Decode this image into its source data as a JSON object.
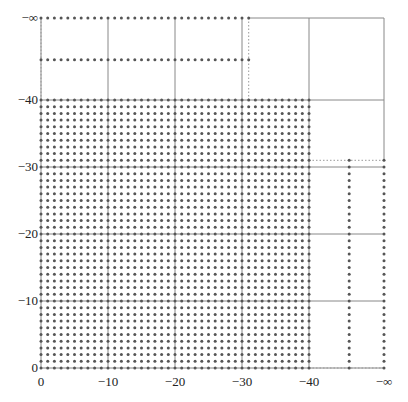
{
  "chart_data": {
    "type": "scatter",
    "title": "",
    "xlabel": "",
    "ylabel": "",
    "x_ticks": [
      "0",
      "−10",
      "−20",
      "−30",
      "−40",
      "−∞"
    ],
    "y_ticks": [
      "0",
      "−10",
      "−20",
      "−30",
      "−40",
      "−∞"
    ],
    "grid": true,
    "regions": [
      {
        "name": "main-block",
        "x_range": [
          0,
          -40
        ],
        "y_range": [
          0,
          -40
        ],
        "step": 1
      },
      {
        "name": "row-neg-inf",
        "x_range": [
          0,
          -31
        ],
        "y": "-inf"
      },
      {
        "name": "row-upper",
        "x_range": [
          0,
          -31
        ],
        "y": -46
      },
      {
        "name": "column-right",
        "x": -46,
        "y_range": [
          0,
          -31
        ]
      },
      {
        "name": "column-neg-inf",
        "x": "-inf",
        "y_range": [
          0,
          -31
        ]
      }
    ],
    "dotted_boundaries": [
      {
        "from": [
          0,
          -40
        ],
        "to": [
          0,
          "-inf"
        ]
      },
      {
        "from": [
          -31,
          -40
        ],
        "to": [
          -31,
          "-inf"
        ]
      },
      {
        "from": [
          -40,
          0
        ],
        "to": [
          "-inf",
          0
        ]
      },
      {
        "from": [
          -40,
          -31
        ],
        "to": [
          "-inf",
          -31
        ]
      }
    ]
  },
  "layout": {
    "origin_px": [
      41,
      368
    ],
    "unit_px": 6.7,
    "neg_inf_px_x": 384,
    "neg_inf_px_y": 18,
    "dot_color": "#555555",
    "grid_color": "#888888",
    "dotted_color": "#999999"
  }
}
